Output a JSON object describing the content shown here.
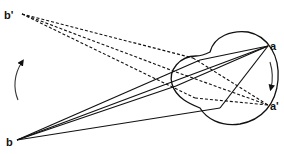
{
  "diagram": {
    "type": "eye-ray-diagram",
    "labels": {
      "b_prime": "b'",
      "b": "b",
      "a": "a",
      "a_prime": "a'"
    },
    "colors": {
      "stroke": "#111111",
      "background": "#ffffff"
    },
    "elements": [
      {
        "name": "eyeball",
        "shape": "circle-with-cornea-bulge"
      },
      {
        "name": "solid-rays",
        "from": "b",
        "to": "a",
        "count": 3,
        "style": "solid"
      },
      {
        "name": "dashed-rays",
        "from": "b'",
        "to": "a'",
        "count": 3,
        "style": "dashed"
      },
      {
        "name": "rotation-arrow-outer",
        "direction": "up",
        "location": "left"
      },
      {
        "name": "rotation-arrow-inner",
        "direction": "down",
        "location": "inside-eye-right"
      }
    ]
  }
}
